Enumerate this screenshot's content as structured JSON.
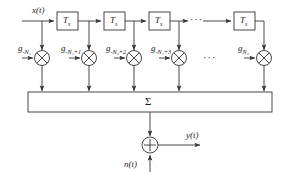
{
  "diagram": {
    "stroke_color": "#333333",
    "text_color": "#1a1a1a",
    "input_signal": "x(t)",
    "output_signal": "y(t)",
    "noise_signal": "n(t)",
    "sum_symbol": "Σ",
    "adder_symbol": "+",
    "multiplier_symbol": "×",
    "ellipsis": "···",
    "delay_blocks": [
      {
        "label": "T",
        "subscript": "s"
      },
      {
        "label": "T",
        "subscript": "s"
      },
      {
        "label": "T",
        "subscript": "s"
      },
      {
        "label": "T",
        "subscript": "s"
      }
    ],
    "coefficients": [
      {
        "label": "g",
        "subscript": "-N₁"
      },
      {
        "label": "g",
        "subscript": "-N₁+1"
      },
      {
        "label": "g",
        "subscript": "-N₁+2"
      },
      {
        "label": "g",
        "subscript": "-N₁+3"
      },
      {
        "label": "g",
        "subscript": "N₂"
      }
    ]
  }
}
